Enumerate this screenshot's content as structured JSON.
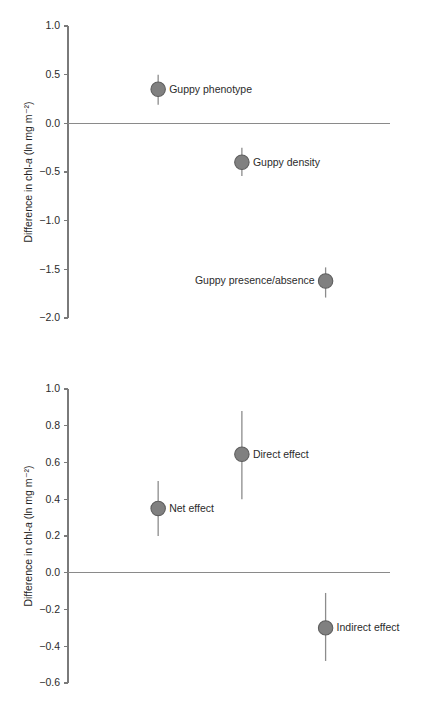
{
  "figure": {
    "background_color": "#ffffff",
    "marker_color": "#808080",
    "marker_edge_color": "#5e5e5e",
    "axis_color": "#7a7a7a",
    "text_color": "#2b2b2b"
  },
  "chart_data": [
    {
      "id": "panel-top",
      "type": "scatter",
      "title": "",
      "xlabel": "",
      "ylabel": "Difference in chl-a (ln mg m⁻²)",
      "ylabel_parts": {
        "pre": "Difference in chl-",
        "italic": "a",
        "post": " (ln mg m⁻²)"
      },
      "ylim": [
        -2.0,
        1.0
      ],
      "yticks": [
        1.0,
        0.5,
        0.0,
        -0.5,
        -1.0,
        -1.5,
        -2.0
      ],
      "ytick_labels": [
        "1.0",
        "0.5",
        "0.0",
        "−0.5",
        "−1.0",
        "−1.5",
        "−2.0"
      ],
      "grid": false,
      "legend": "none",
      "reference_line": {
        "y": 0.0,
        "label": "zero-line"
      },
      "categories": [
        "Guppy phenotype",
        "Guppy density",
        "Guppy presence/absence"
      ],
      "values": [
        0.35,
        -0.4,
        -1.62
      ],
      "ci_low": [
        0.19,
        -0.54,
        -1.79
      ],
      "ci_high": [
        0.5,
        -0.25,
        -1.48
      ],
      "x_positions": [
        0.28,
        0.54,
        0.8
      ],
      "label_side": [
        "right",
        "right",
        "left"
      ]
    },
    {
      "id": "panel-bottom",
      "type": "scatter",
      "title": "",
      "xlabel": "",
      "ylabel": "Difference in chl-a (ln mg m⁻²)",
      "ylabel_parts": {
        "pre": "Difference in chl-",
        "italic": "a",
        "post": " (ln mg m⁻²)"
      },
      "ylim": [
        -0.6,
        1.0
      ],
      "yticks": [
        1.0,
        0.8,
        0.6,
        0.4,
        0.2,
        0.0,
        -0.2,
        -0.4,
        -0.6
      ],
      "ytick_labels": [
        "1.0",
        "0.8",
        "0.6",
        "0.4",
        "0.2",
        "0.0",
        "−0.2",
        "−0.4",
        "−0.6"
      ],
      "grid": false,
      "legend": "none",
      "reference_line": {
        "y": 0.0,
        "label": "zero-line"
      },
      "categories": [
        "Net effect",
        "Direct effect",
        "Indirect effect"
      ],
      "values": [
        0.35,
        0.645,
        -0.3
      ],
      "ci_low": [
        0.2,
        0.4,
        -0.48
      ],
      "ci_high": [
        0.5,
        0.88,
        -0.11
      ],
      "x_positions": [
        0.28,
        0.54,
        0.8
      ],
      "label_side": [
        "right",
        "right",
        "right"
      ]
    }
  ]
}
